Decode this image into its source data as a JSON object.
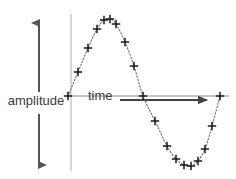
{
  "figure": {
    "background_color": "#ffffff"
  },
  "labels": {
    "amplitude": "amplitude",
    "time": "time"
  },
  "annotations": {
    "amplitude_arrow": {
      "name": "amplitude-double-arrow",
      "orientation": "vertical",
      "double_headed": true,
      "x": 39,
      "y_top": 22,
      "y_bottom": 166,
      "color": "#555555"
    },
    "time_arrow": {
      "name": "time-arrow",
      "orientation": "horizontal",
      "double_headed": false,
      "y": 100,
      "x_start": 120,
      "x_end": 209,
      "color": "#444444"
    }
  },
  "axes": {
    "horizontal_axis": {
      "x_start": 67,
      "x_end": 229,
      "y": 96,
      "color": "#8a8a8a"
    },
    "vertical_reference_line": {
      "x": 71,
      "y_top": 14,
      "y_bottom": 171,
      "color": "#b0b0b0"
    }
  },
  "chart_data": {
    "type": "line",
    "title": "",
    "xlabel": "time",
    "ylabel": "amplitude",
    "grid": false,
    "legend": null,
    "marker": "plus",
    "line_style": "dotted",
    "line_color": "#6e6e6e",
    "marker_color": "#1a1a1a",
    "xlim": [
      67,
      229
    ],
    "ylim": [
      18,
      167
    ],
    "baseline_y": 96,
    "points": [
      {
        "x": 68,
        "y": 96
      },
      {
        "x": 78,
        "y": 72
      },
      {
        "x": 88,
        "y": 48
      },
      {
        "x": 97,
        "y": 29
      },
      {
        "x": 104,
        "y": 20
      },
      {
        "x": 110,
        "y": 19
      },
      {
        "x": 116,
        "y": 24
      },
      {
        "x": 125,
        "y": 42
      },
      {
        "x": 134,
        "y": 66
      },
      {
        "x": 143,
        "y": 96
      },
      {
        "x": 155,
        "y": 121
      },
      {
        "x": 167,
        "y": 146
      },
      {
        "x": 176,
        "y": 159
      },
      {
        "x": 184,
        "y": 165
      },
      {
        "x": 191,
        "y": 166
      },
      {
        "x": 198,
        "y": 161
      },
      {
        "x": 205,
        "y": 149
      },
      {
        "x": 212,
        "y": 126
      },
      {
        "x": 220,
        "y": 96
      }
    ]
  }
}
